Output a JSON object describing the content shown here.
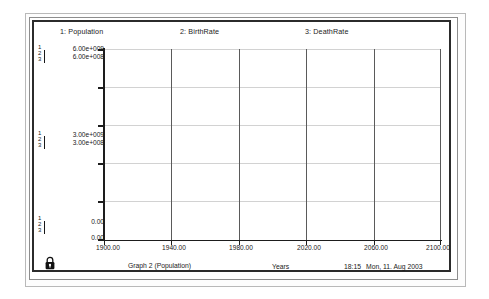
{
  "window": {
    "title_bar_present": false,
    "lock_icon": "lock-icon"
  },
  "legend": [
    {
      "id": "1",
      "label": "1: Population"
    },
    {
      "id": "2",
      "label": "2: BirthRate"
    },
    {
      "id": "3",
      "label": "3: DeathRate"
    }
  ],
  "y_scales": {
    "top": {
      "series1": "6.00e+009",
      "series2": "6.00e+008"
    },
    "middle": {
      "series1": "3.00e+009",
      "series2": "3.00e+008"
    },
    "bottom": {
      "series1": "0.00",
      "series2": "0.00"
    },
    "brackets": [
      "1",
      "2",
      "3"
    ]
  },
  "x_axis": {
    "label": "Years",
    "ticks": [
      "1900.00",
      "1940.00",
      "1980.00",
      "2020.00",
      "2060.00",
      "2100.00"
    ],
    "min": 1900,
    "max": 2100
  },
  "footer": {
    "graph_name": "Graph 2 (Population)",
    "axis_name": "Years",
    "time": "18:15",
    "date": "Mon, 11. Aug 2003"
  },
  "colors": {
    "curve": "#262626",
    "grid_major": "#5a5a5a",
    "grid_minor": "#d2d2d2",
    "axis": "#1d1d1d",
    "frame": "#2b2b2b"
  },
  "chart_data": {
    "type": "line",
    "title": "Graph 2 (Population)",
    "xlabel": "Years",
    "ylabel": "",
    "grid": true,
    "legend_position": "top",
    "xlim": [
      1900,
      2100
    ],
    "x": [
      1900,
      1910,
      1920,
      1930,
      1940,
      1950,
      1960,
      1970,
      1980,
      1990,
      2000,
      2010,
      2020,
      2030,
      2040,
      2050,
      2060,
      2070,
      2080,
      2090,
      2100
    ],
    "series": [
      {
        "name": "Population",
        "marker": "1",
        "ylim": [
          0,
          6000000000.0
        ],
        "ytick_labels": [
          "0.00",
          "3.00e+009",
          "6.00e+009"
        ],
        "values": [
          1600000000.0,
          1750000000.0,
          1900000000.0,
          2100000000.0,
          2350000000.0,
          2600000000.0,
          3050000000.0,
          3700000000.0,
          4450000000.0,
          5100000000.0,
          5550000000.0,
          5850000000.0,
          5980000000.0,
          5950000000.0,
          5750000000.0,
          5450000000.0,
          5050000000.0,
          4700000000.0,
          4400000000.0,
          4180000000.0,
          4020000000.0
        ]
      },
      {
        "name": "BirthRate",
        "marker": "2",
        "ylim": [
          0,
          600000000.0
        ],
        "ytick_labels": [
          "0.00",
          "3.00e+008",
          "6.00e+008"
        ],
        "values": [
          62000000.0,
          70000000.0,
          80000000.0,
          92000000.0,
          105000000.0,
          118000000.0,
          130000000.0,
          145000000.0,
          158000000.0,
          168000000.0,
          178000000.0,
          186000000.0,
          192000000.0,
          195000000.0,
          193000000.0,
          188000000.0,
          180000000.0,
          170000000.0,
          160000000.0,
          152000000.0,
          147000000.0
        ]
      },
      {
        "name": "DeathRate",
        "marker": "3",
        "ylim": [
          0,
          600000000.0
        ],
        "ytick_labels": [
          "0.00",
          "3.00e+008",
          "6.00e+008"
        ],
        "values": [
          48000000.0,
          48000000.0,
          49000000.0,
          50000000.0,
          52000000.0,
          58000000.0,
          70000000.0,
          88000000.0,
          112000000.0,
          138000000.0,
          162000000.0,
          182000000.0,
          195000000.0,
          205000000.0,
          208000000.0,
          206000000.0,
          200000000.0,
          190000000.0,
          178000000.0,
          168000000.0,
          160000000.0
        ]
      }
    ]
  }
}
